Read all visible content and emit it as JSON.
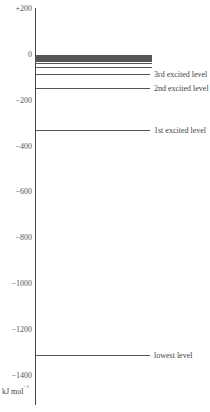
{
  "chart_data": {
    "type": "energy-level-diagram",
    "title": "",
    "ylabel": "kJ mol-1",
    "ylim": [
      -1450,
      200
    ],
    "y_ticks": [
      200,
      0,
      -200,
      -400,
      -600,
      -800,
      -1000,
      -1200,
      -1400
    ],
    "y_tick_labels": [
      "+200",
      "0",
      "−200",
      "−400",
      "−600",
      "−800",
      "−1000",
      "−1200",
      "−1400"
    ],
    "levels": [
      {
        "name": "lowest level",
        "energy": -1312,
        "labeled": true
      },
      {
        "name": "1st excited level",
        "energy": -328,
        "labeled": true
      },
      {
        "name": "2nd excited level",
        "energy": -146,
        "labeled": true
      },
      {
        "name": "3rd excited level",
        "energy": -82,
        "labeled": true
      },
      {
        "name": "",
        "energy": -52,
        "labeled": false
      },
      {
        "name": "",
        "energy": -36,
        "labeled": false
      },
      {
        "name": "",
        "energy": -27,
        "labeled": false
      },
      {
        "name": "",
        "energy": -20,
        "labeled": false
      },
      {
        "name": "",
        "energy": -16,
        "labeled": false
      },
      {
        "name": "",
        "energy": -13,
        "labeled": false
      },
      {
        "name": "",
        "energy": -8,
        "labeled": false
      },
      {
        "name": "",
        "energy": -4,
        "labeled": false
      },
      {
        "name": "",
        "energy": -1,
        "labeled": false
      }
    ]
  },
  "labels": {
    "unit_main": "kJ  mol",
    "unit_sup": "−1"
  }
}
